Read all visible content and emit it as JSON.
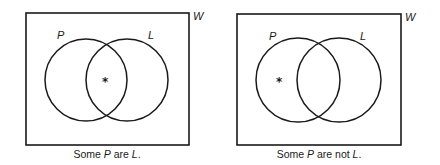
{
  "diagrams": [
    {
      "universe_label": "W",
      "set_left_label": "P",
      "set_right_label": "L",
      "marker": "*",
      "marker_region": "P and L (intersection)",
      "caption": {
        "pre": "Some ",
        "subject": "P",
        "mid": " are ",
        "predicate": "L",
        "post": "."
      }
    },
    {
      "universe_label": "W",
      "set_left_label": "P",
      "set_right_label": "L",
      "marker": "*",
      "marker_region": "P only (not L)",
      "caption": {
        "pre": "Some ",
        "subject": "P",
        "mid": " are not ",
        "predicate": "L",
        "post": "."
      }
    }
  ]
}
